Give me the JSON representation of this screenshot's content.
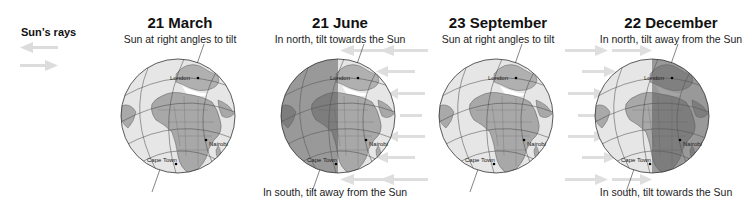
{
  "legend": {
    "title": "Sun’s rays",
    "arrow_left_icon": "arrow-left",
    "arrow_right_icon": "arrow-right",
    "arrow_color": "#d8d8d8"
  },
  "panels": [
    {
      "date": "21 March",
      "subtitle": "Sun at right angles to tilt",
      "bottom": "",
      "shadow": "none",
      "rays": "none"
    },
    {
      "date": "21 June",
      "subtitle": "In north, tilt towards the Sun",
      "bottom": "In south, tilt away from the Sun",
      "shadow": "left",
      "rays": "from-right"
    },
    {
      "date": "23 September",
      "subtitle": "Sun at right angles to tilt",
      "bottom": "",
      "shadow": "none",
      "rays": "none"
    },
    {
      "date": "22 December",
      "subtitle": "In north, tilt away from the Sun",
      "bottom": "In south, tilt towards the Sun",
      "shadow": "right",
      "rays": "from-left"
    }
  ],
  "cities": [
    "London",
    "Nairobi",
    "Cape Town"
  ],
  "colors": {
    "ocean": "#e8e8e8",
    "land": "#a8a8a8",
    "shadow": "#7a7a7a",
    "grid": "#555555",
    "rays": "#dcdcdc"
  }
}
